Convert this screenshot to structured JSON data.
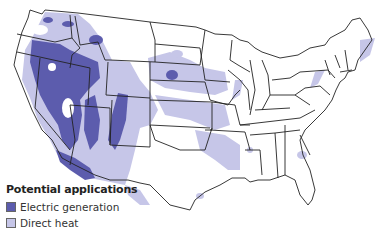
{
  "map": {
    "subject": "Geothermal potential applications, contiguous United States",
    "colors": {
      "electric_generation": "#5c5cad",
      "direct_heat": "#c6c6e8",
      "state_borders": "#222222",
      "background": "#ffffff"
    }
  },
  "legend": {
    "title": "Potential applications",
    "items": [
      {
        "label": "Electric generation",
        "color": "#5c5cad"
      },
      {
        "label": "Direct heat",
        "color": "#c6c6e8"
      }
    ]
  }
}
